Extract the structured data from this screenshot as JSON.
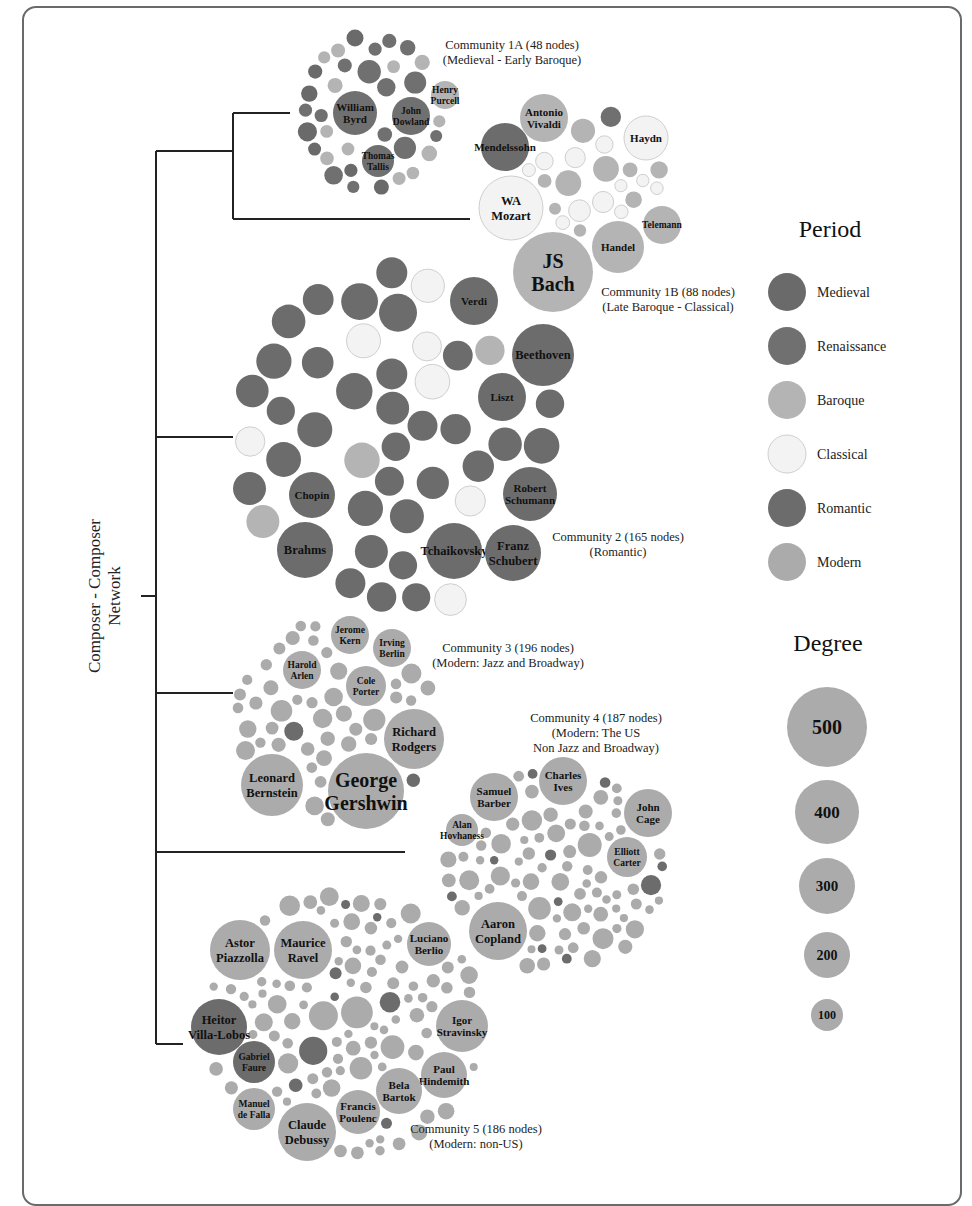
{
  "figure": {
    "root_label_lines": [
      "Composer - Composer",
      "Network"
    ]
  },
  "colors": {
    "Medieval": "#6a6a6a",
    "Renaissance": "#707070",
    "Baroque": "#b4b4b4",
    "Classical": "#f3f3f3",
    "Romantic": "#6c6c6c",
    "Modern": "#ababab",
    "Outline": "#d0d0d0"
  },
  "legend_period": {
    "title": "Period",
    "items": [
      {
        "label": "Medieval",
        "period": "Medieval"
      },
      {
        "label": "Renaissance",
        "period": "Renaissance"
      },
      {
        "label": "Baroque",
        "period": "Baroque"
      },
      {
        "label": "Classical",
        "period": "Classical"
      },
      {
        "label": "Romantic",
        "period": "Romantic"
      },
      {
        "label": "Modern",
        "period": "Modern"
      }
    ]
  },
  "legend_degree": {
    "title": "Degree",
    "items": [
      {
        "label": "500",
        "r": 40
      },
      {
        "label": "400",
        "r": 32
      },
      {
        "label": "300",
        "r": 28
      },
      {
        "label": "200",
        "r": 23
      },
      {
        "label": "100",
        "r": 16
      }
    ]
  },
  "communities": [
    {
      "id": "1A",
      "title": "Community 1A (48 nodes)",
      "subtitle": [
        "(Medieval - Early Baroque)"
      ],
      "node_count": 48,
      "named_nodes": [
        {
          "name": [
            "William",
            "Byrd"
          ],
          "cx": 355,
          "cy": 113,
          "r": 22,
          "period": "Renaissance"
        },
        {
          "name": [
            "John",
            "Dowland"
          ],
          "cx": 411,
          "cy": 116,
          "r": 19,
          "period": "Renaissance"
        },
        {
          "name": [
            "Thomas",
            "Tallis"
          ],
          "cx": 378,
          "cy": 161,
          "r": 16,
          "period": "Renaissance"
        },
        {
          "name": [
            "Henry",
            "Purcell"
          ],
          "cx": 445,
          "cy": 95,
          "r": 14,
          "period": "Baroque"
        }
      ]
    },
    {
      "id": "1B",
      "title": "Community 1B (88 nodes)",
      "subtitle": [
        "(Late Baroque - Classical)"
      ],
      "node_count": 88,
      "named_nodes": [
        {
          "name": [
            "JS",
            "Bach"
          ],
          "cx": 553,
          "cy": 272,
          "r": 40,
          "period": "Baroque"
        },
        {
          "name": [
            "WA",
            "Mozart"
          ],
          "cx": 511,
          "cy": 208,
          "r": 32,
          "period": "Classical"
        },
        {
          "name": [
            "Antonio",
            "Vivaldi"
          ],
          "cx": 544,
          "cy": 118,
          "r": 24,
          "period": "Baroque"
        },
        {
          "name": [
            "Mendelssohn"
          ],
          "cx": 505,
          "cy": 147,
          "r": 24,
          "period": "Romantic"
        },
        {
          "name": [
            "Haydn"
          ],
          "cx": 646,
          "cy": 138,
          "r": 22,
          "period": "Classical"
        },
        {
          "name": [
            "Handel"
          ],
          "cx": 618,
          "cy": 247,
          "r": 26,
          "period": "Baroque"
        },
        {
          "name": [
            "Telemann"
          ],
          "cx": 662,
          "cy": 225,
          "r": 19,
          "period": "Baroque"
        }
      ]
    },
    {
      "id": "2",
      "title": "Community 2 (165 nodes)",
      "subtitle": [
        "(Romantic)"
      ],
      "node_count": 165,
      "named_nodes": [
        {
          "name": [
            "Verdi"
          ],
          "cx": 474,
          "cy": 301,
          "r": 24,
          "period": "Romantic"
        },
        {
          "name": [
            "Beethoven"
          ],
          "cx": 543,
          "cy": 355,
          "r": 31,
          "period": "Romantic"
        },
        {
          "name": [
            "Liszt"
          ],
          "cx": 502,
          "cy": 397,
          "r": 24,
          "period": "Romantic"
        },
        {
          "name": [
            "Chopin"
          ],
          "cx": 312,
          "cy": 495,
          "r": 23,
          "period": "Romantic"
        },
        {
          "name": [
            "Robert",
            "Schumann"
          ],
          "cx": 530,
          "cy": 494,
          "r": 27,
          "period": "Romantic"
        },
        {
          "name": [
            "Brahms"
          ],
          "cx": 305,
          "cy": 550,
          "r": 28,
          "period": "Romantic"
        },
        {
          "name": [
            "Tchaikovsky"
          ],
          "cx": 454,
          "cy": 551,
          "r": 28,
          "period": "Romantic"
        },
        {
          "name": [
            "Franz",
            "Schubert"
          ],
          "cx": 513,
          "cy": 553,
          "r": 28,
          "period": "Romantic"
        }
      ]
    },
    {
      "id": "3",
      "title": "Community 3 (196 nodes)",
      "subtitle": [
        "(Modern: Jazz and Broadway)"
      ],
      "node_count": 196,
      "named_nodes": [
        {
          "name": [
            "Jerome",
            "Kern"
          ],
          "cx": 350,
          "cy": 635,
          "r": 19,
          "period": "Modern"
        },
        {
          "name": [
            "Irving",
            "Berlin"
          ],
          "cx": 392,
          "cy": 648,
          "r": 19,
          "period": "Modern"
        },
        {
          "name": [
            "Harold",
            "Arlen"
          ],
          "cx": 302,
          "cy": 670,
          "r": 19,
          "period": "Modern"
        },
        {
          "name": [
            "Cole",
            "Porter"
          ],
          "cx": 366,
          "cy": 686,
          "r": 20,
          "period": "Modern"
        },
        {
          "name": [
            "Richard",
            "Rodgers"
          ],
          "cx": 414,
          "cy": 739,
          "r": 30,
          "period": "Modern"
        },
        {
          "name": [
            "Leonard",
            "Bernstein"
          ],
          "cx": 272,
          "cy": 785,
          "r": 31,
          "period": "Modern"
        },
        {
          "name": [
            "George",
            "Gershwin"
          ],
          "cx": 366,
          "cy": 791,
          "r": 38,
          "period": "Modern"
        }
      ]
    },
    {
      "id": "4",
      "title": "Community 4 (187 nodes)",
      "subtitle": [
        "(Modern: The US",
        "Non Jazz and Broadway)"
      ],
      "node_count": 187,
      "named_nodes": [
        {
          "name": [
            "Charles",
            "Ives"
          ],
          "cx": 563,
          "cy": 781,
          "r": 24,
          "period": "Modern"
        },
        {
          "name": [
            "Samuel",
            "Barber"
          ],
          "cx": 494,
          "cy": 797,
          "r": 24,
          "period": "Modern"
        },
        {
          "name": [
            "John",
            "Cage"
          ],
          "cx": 648,
          "cy": 813,
          "r": 24,
          "period": "Modern"
        },
        {
          "name": [
            "Alan",
            "Hovhaness"
          ],
          "cx": 462,
          "cy": 830,
          "r": 16,
          "period": "Modern"
        },
        {
          "name": [
            "Elliott",
            "Carter"
          ],
          "cx": 627,
          "cy": 857,
          "r": 20,
          "period": "Modern"
        },
        {
          "name": [
            "Aaron",
            "Copland"
          ],
          "cx": 498,
          "cy": 931,
          "r": 29,
          "period": "Modern"
        }
      ]
    },
    {
      "id": "5",
      "title": "Community 5 (186 nodes)",
      "subtitle": [
        "(Modern: non-US)"
      ],
      "node_count": 186,
      "named_nodes": [
        {
          "name": [
            "Astor",
            "Piazzolla"
          ],
          "cx": 240,
          "cy": 950,
          "r": 30,
          "period": "Modern"
        },
        {
          "name": [
            "Maurice",
            "Ravel"
          ],
          "cx": 303,
          "cy": 950,
          "r": 29,
          "period": "Modern"
        },
        {
          "name": [
            "Luciano",
            "Berlio"
          ],
          "cx": 429,
          "cy": 944,
          "r": 22,
          "period": "Modern"
        },
        {
          "name": [
            "Heitor",
            "Villa-Lobos"
          ],
          "cx": 219,
          "cy": 1027,
          "r": 28,
          "period": "Romantic"
        },
        {
          "name": [
            "Igor",
            "Stravinsky"
          ],
          "cx": 462,
          "cy": 1026,
          "r": 26,
          "period": "Modern"
        },
        {
          "name": [
            "Gabriel",
            "Faure"
          ],
          "cx": 254,
          "cy": 1062,
          "r": 21,
          "period": "Romantic"
        },
        {
          "name": [
            "Paul",
            "Hindemith"
          ],
          "cx": 444,
          "cy": 1075,
          "r": 23,
          "period": "Modern"
        },
        {
          "name": [
            "Bela",
            "Bartok"
          ],
          "cx": 399,
          "cy": 1091,
          "r": 23,
          "period": "Modern"
        },
        {
          "name": [
            "Manuel",
            "de Falla"
          ],
          "cx": 254,
          "cy": 1109,
          "r": 21,
          "period": "Modern"
        },
        {
          "name": [
            "Francis",
            "Poulenc"
          ],
          "cx": 358,
          "cy": 1112,
          "r": 22,
          "period": "Modern"
        },
        {
          "name": [
            "Claude",
            "Debussy"
          ],
          "cx": 307,
          "cy": 1132,
          "r": 29,
          "period": "Modern"
        }
      ]
    }
  ],
  "chart_data": {
    "type": "diagram",
    "title": "Composer - Composer Network",
    "structure": "dendrogram of communities with packed-bubble clusters",
    "legend_period": [
      "Medieval",
      "Renaissance",
      "Baroque",
      "Classical",
      "Romantic",
      "Modern"
    ],
    "legend_degree": [
      500,
      400,
      300,
      200,
      100
    ],
    "communities": [
      {
        "name": "Community 1A",
        "nodes": 48,
        "description": "Medieval - Early Baroque",
        "labeled": [
          "William Byrd",
          "John Dowland",
          "Thomas Tallis",
          "Henry Purcell"
        ]
      },
      {
        "name": "Community 1B",
        "nodes": 88,
        "description": "Late Baroque - Classical",
        "labeled": [
          "JS Bach",
          "WA Mozart",
          "Antonio Vivaldi",
          "Mendelssohn",
          "Haydn",
          "Handel",
          "Telemann"
        ]
      },
      {
        "name": "Community 2",
        "nodes": 165,
        "description": "Romantic",
        "labeled": [
          "Verdi",
          "Beethoven",
          "Liszt",
          "Chopin",
          "Robert Schumann",
          "Brahms",
          "Tchaikovsky",
          "Franz Schubert"
        ]
      },
      {
        "name": "Community 3",
        "nodes": 196,
        "description": "Modern: Jazz and Broadway",
        "labeled": [
          "Jerome Kern",
          "Irving Berlin",
          "Harold Arlen",
          "Cole Porter",
          "Richard Rodgers",
          "Leonard Bernstein",
          "George Gershwin"
        ]
      },
      {
        "name": "Community 4",
        "nodes": 187,
        "description": "Modern: The US Non Jazz and Broadway",
        "labeled": [
          "Charles Ives",
          "Samuel Barber",
          "John Cage",
          "Alan Hovhaness",
          "Elliott Carter",
          "Aaron Copland"
        ]
      },
      {
        "name": "Community 5",
        "nodes": 186,
        "description": "Modern: non-US",
        "labeled": [
          "Astor Piazzolla",
          "Maurice Ravel",
          "Luciano Berlio",
          "Heitor Villa-Lobos",
          "Igor Stravinsky",
          "Gabriel Faure",
          "Paul Hindemith",
          "Bela Bartok",
          "Manuel de Falla",
          "Francis Poulenc",
          "Claude Debussy"
        ]
      }
    ],
    "dendrogram": {
      "root": "Composer - Composer Network",
      "children": [
        {
          "children": [
            {
              "children": [
                "Community 1A",
                "Community 1B"
              ]
            },
            "Community 2"
          ]
        },
        {
          "children": [
            "Community 3",
            "Community 4",
            "Community 5"
          ]
        }
      ]
    }
  }
}
